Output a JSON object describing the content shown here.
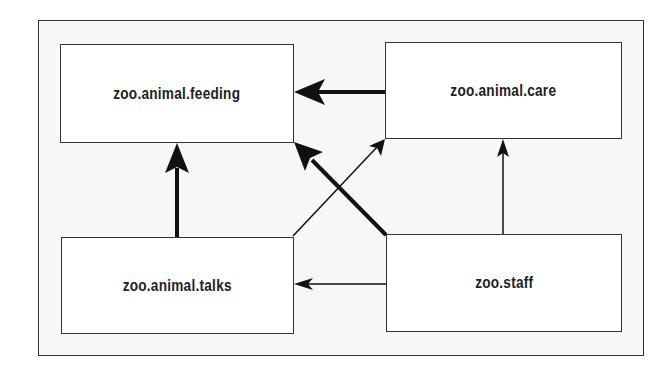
{
  "diagram": {
    "nodes": [
      {
        "id": "feeding",
        "label": "zoo.animal.feeding"
      },
      {
        "id": "care",
        "label": "zoo.animal.care"
      },
      {
        "id": "talks",
        "label": "zoo.animal.talks"
      },
      {
        "id": "staff",
        "label": "zoo.staff"
      }
    ],
    "edges": [
      {
        "from": "care",
        "to": "feeding",
        "weight": "thick"
      },
      {
        "from": "talks",
        "to": "feeding",
        "weight": "thick"
      },
      {
        "from": "staff",
        "to": "feeding",
        "weight": "thick"
      },
      {
        "from": "talks",
        "to": "care",
        "weight": "thin"
      },
      {
        "from": "staff",
        "to": "care",
        "weight": "thin"
      },
      {
        "from": "staff",
        "to": "talks",
        "weight": "thin"
      }
    ]
  }
}
